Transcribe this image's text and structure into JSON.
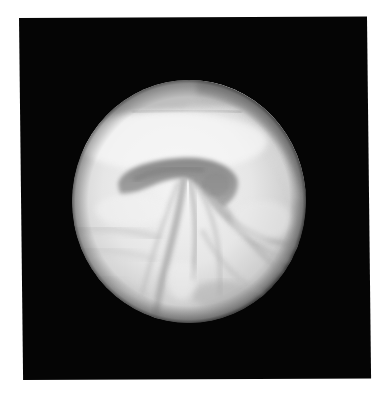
{
  "image": {
    "description": "Grayscale photograph of a spherical body with swirling cloud-like flow patterns, shown inside a black square frame on a white page",
    "colors": {
      "page_background": "#ffffff",
      "frame": "#050505",
      "disc_light": "#f2f2f2",
      "disc_mid": "#c4c4c4",
      "disc_band": "#9c9c9c",
      "disc_dark": "#7e7e7e",
      "limb_shadow": "#5a5a5a"
    },
    "frame_box": {
      "left": 19,
      "top": 18,
      "width": 348,
      "height": 362
    },
    "disc_box": {
      "left": 72,
      "top": 80,
      "width": 234,
      "height": 243
    },
    "features": [
      "grey arc band along upper-right limb",
      "dark mushroom-shaped cap spanning the center",
      "converging vertical streaks below the cap",
      "curved flow lines sweeping to the lower right",
      "faint darker band along the upper-left limb"
    ]
  }
}
